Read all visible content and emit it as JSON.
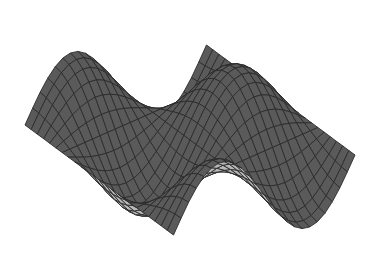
{
  "chart_data": {
    "type": "surface",
    "title": "",
    "xlabel": "",
    "ylabel": "",
    "zlabel": "",
    "axes_visible": false,
    "grid": false,
    "legend": null,
    "function": "z = sin(x) * cos(y)",
    "x_range": [
      -3.14159,
      3.14159
    ],
    "y_range": [
      -3.14159,
      3.14159
    ],
    "mesh_resolution": [
      24,
      24
    ],
    "render_style": "shaded wireframe mesh",
    "colors": {
      "background": "#ffffff",
      "front_face": "#b8b8b8",
      "back_face": "#5a5a5a",
      "mesh_lines": "#2b2b2b"
    },
    "projection": {
      "origin": [
        190,
        140
      ],
      "x_axis": [
        -4.6,
        22.5
      ],
      "y_axis": [
        22.5,
        6.2
      ],
      "z_scale": 52
    }
  }
}
